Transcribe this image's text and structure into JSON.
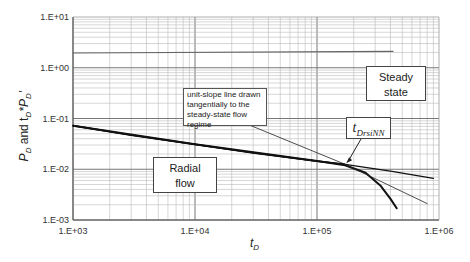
{
  "chart_data": {
    "type": "line",
    "title": "",
    "xlabel": "t_D",
    "ylabel": "P_D and t_D*P_D'",
    "xscale": "log",
    "yscale": "log",
    "xlim": [
      1000,
      1000000
    ],
    "ylim": [
      0.001,
      10
    ],
    "grid": true,
    "x_tick_labels": [
      "1.E+03",
      "1.E+04",
      "1.E+05",
      "1.E+06"
    ],
    "y_tick_labels": [
      "1.E+01",
      "1.E+00",
      "1.E-01",
      "1.E-02",
      "1.E-03"
    ],
    "series": [
      {
        "name": "horizontal reference line",
        "style": "thin gray",
        "x": [
          1000,
          420000
        ],
        "y": [
          1.95,
          2.1
        ]
      },
      {
        "name": "radial flow derivative (continues)",
        "style": "thick then thin black",
        "x": [
          1000,
          3000,
          10000,
          30000,
          100000,
          170000,
          400000,
          900000
        ],
        "y": [
          0.072,
          0.047,
          0.031,
          0.021,
          0.0145,
          0.0125,
          0.0092,
          0.0066
        ]
      },
      {
        "name": "steady-state decline curve",
        "style": "thick black",
        "x": [
          1000,
          10000,
          100000,
          170000,
          250000,
          330000,
          400000,
          450000
        ],
        "y": [
          0.072,
          0.031,
          0.0145,
          0.012,
          0.0085,
          0.0048,
          0.0026,
          0.0017
        ]
      },
      {
        "name": "unit-slope tangent line",
        "style": "thin black",
        "x": [
          23000,
          170000,
          800000
        ],
        "y": [
          0.09,
          0.0125,
          0.0021
        ]
      }
    ],
    "annotations": [
      {
        "text": "Steady state",
        "type": "box"
      },
      {
        "text": "Radial flow",
        "type": "box"
      },
      {
        "text": "unit-slope line drawn tangentially to the steady-state flow regime",
        "type": "box-with-leader"
      },
      {
        "text": "t_DrsiNN",
        "type": "box-with-arrow",
        "points_to": {
          "x": 170000,
          "y": 0.0125
        }
      }
    ]
  },
  "labels": {
    "y_axis_main": "P",
    "y_axis_sub1": "D",
    "y_axis_mid": " and  t",
    "y_axis_sub2": "D",
    "y_axis_star": "*P",
    "y_axis_sub3": "D",
    "y_axis_prime": "'",
    "x_axis_main": "t",
    "x_axis_sub": "D",
    "steady_line1": "Steady",
    "steady_line2": "state",
    "radial_line1": "Radial",
    "radial_line2": "flow",
    "note_text": "unit-slope line drawn tangentially to the steady-state flow regime",
    "tdrsi_main": "t",
    "tdrsi_sub": "DrsiNN"
  }
}
